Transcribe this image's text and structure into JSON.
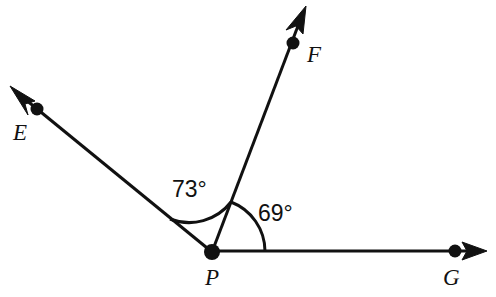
{
  "diagram": {
    "type": "angle-diagram",
    "background_color": "#ffffff",
    "stroke_color": "#111111",
    "vertex": {
      "label": "P",
      "x": 212,
      "y": 252,
      "label_x": 205,
      "label_y": 285
    },
    "rays": [
      {
        "name": "ray-PE",
        "label": "E",
        "direction_degrees": 142,
        "point_x": 37,
        "point_y": 109,
        "tip_x": 12,
        "tip_y": 88,
        "label_x": 13,
        "label_y": 140
      },
      {
        "name": "ray-PF",
        "label": "F",
        "direction_degrees": 69,
        "point_x": 293,
        "point_y": 43,
        "tip_x": 305,
        "tip_y": 8,
        "label_x": 307,
        "label_y": 62
      },
      {
        "name": "ray-PG",
        "label": "G",
        "direction_degrees": 0,
        "point_x": 455,
        "point_y": 251,
        "tip_x": 486,
        "tip_y": 251,
        "label_x": 443,
        "label_y": 285
      }
    ],
    "angles": [
      {
        "name": "angle-EPF",
        "value_label": "73°",
        "measure": 73,
        "between": [
          "E",
          "F"
        ],
        "start_degrees": 69,
        "end_degrees": 142,
        "radius": 53,
        "label_x": 172,
        "label_y": 197
      },
      {
        "name": "angle-FPG",
        "value_label": "69°",
        "measure": 69,
        "between": [
          "F",
          "G"
        ],
        "start_degrees": 0,
        "end_degrees": 69,
        "radius": 53,
        "label_x": 258,
        "label_y": 221
      }
    ]
  }
}
